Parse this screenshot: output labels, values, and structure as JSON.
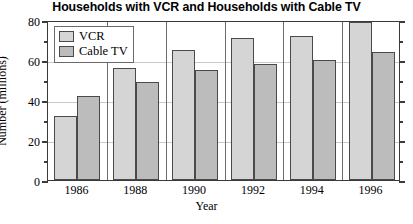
{
  "chart_data": {
    "type": "bar",
    "title": "Households with VCR and Households with Cable TV",
    "xlabel": "Year",
    "ylabel": "Number (millions)",
    "categories": [
      "1986",
      "1988",
      "1990",
      "1992",
      "1994",
      "1996"
    ],
    "series": [
      {
        "name": "VCR",
        "values": [
          32,
          56,
          65,
          71,
          72,
          79
        ],
        "color": "#d5d5d5"
      },
      {
        "name": "Cable TV",
        "values": [
          42,
          49,
          55,
          58,
          60,
          64
        ],
        "color": "#bcbcbc"
      }
    ],
    "ylim": [
      0,
      80
    ],
    "y_ticks": [
      0,
      20,
      40,
      60,
      80
    ],
    "y_minor_ticks": [
      10,
      30,
      50,
      70
    ],
    "grid": true,
    "legend_position": "top-left",
    "legend_entries": [
      "VCR",
      "Cable TV"
    ]
  },
  "axis": {
    "y_tick_labels": [
      "0",
      "20",
      "40",
      "60",
      "80"
    ],
    "x_tick_labels": [
      "1986",
      "1988",
      "1990",
      "1992",
      "1994",
      "1996"
    ]
  }
}
